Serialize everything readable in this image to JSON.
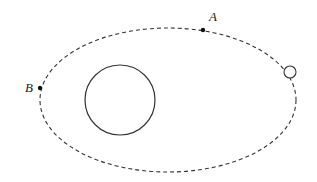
{
  "diagram": {
    "orbit": {
      "style": "dashed",
      "color": "#333333"
    },
    "central_body": {
      "label": "",
      "color": "#333333"
    },
    "satellite": {
      "label": "",
      "color": "#333333"
    },
    "points": [
      {
        "id": "A",
        "label": "A"
      },
      {
        "id": "B",
        "label": "B"
      }
    ]
  }
}
